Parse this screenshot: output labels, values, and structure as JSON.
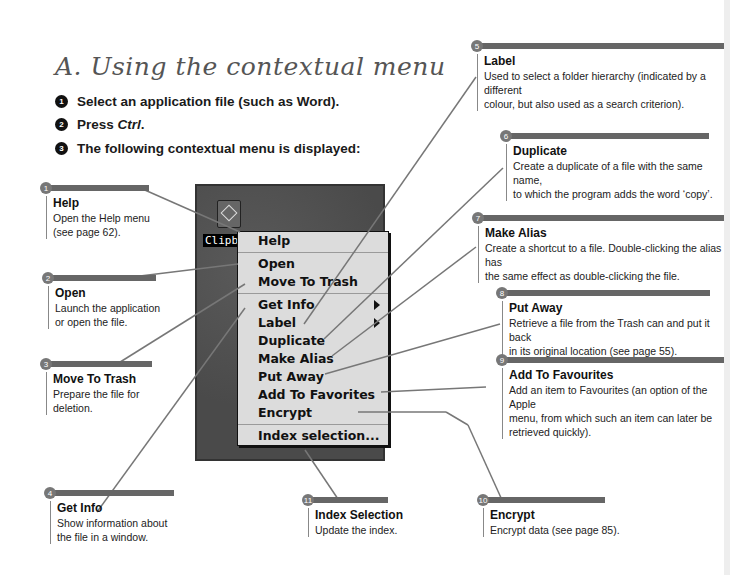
{
  "title": "A. Using the contextual menu",
  "steps": [
    {
      "num": "1",
      "text": "Select an application file (such as Word)."
    },
    {
      "num": "2",
      "text_prefix": "Press ",
      "text_italic": "Ctrl",
      "text_suffix": "."
    },
    {
      "num": "3",
      "text": "The following contextual menu is displayed:"
    }
  ],
  "screenshot": {
    "file_label": "Clipbo",
    "file_icon": "clipboard-icon",
    "menu_items": [
      {
        "label": "Help"
      },
      {
        "label": "Open"
      },
      {
        "label": "Move To Trash"
      },
      {
        "label": "Get Info",
        "submenu": true
      },
      {
        "label": "Label",
        "submenu": true
      },
      {
        "label": "Duplicate"
      },
      {
        "label": "Make Alias"
      },
      {
        "label": "Put Away"
      },
      {
        "label": "Add To Favorites"
      },
      {
        "label": "Encrypt"
      },
      {
        "label": "Index selection..."
      }
    ]
  },
  "callouts": [
    {
      "num": "1",
      "heading": "Help",
      "lines": [
        "Open the Help menu",
        "(see page 62)."
      ]
    },
    {
      "num": "2",
      "heading": "Open",
      "lines": [
        "Launch the application",
        "or open the file."
      ]
    },
    {
      "num": "3",
      "heading": "Move To Trash",
      "lines": [
        "Prepare the file for",
        "deletion."
      ]
    },
    {
      "num": "4",
      "heading": "Get Info",
      "lines": [
        "Show information about",
        "the file in a window."
      ]
    },
    {
      "num": "5",
      "heading": "Label",
      "lines": [
        "Used to select a folder hierarchy (indicated by a different",
        "colour, but also used as a search criterion)."
      ]
    },
    {
      "num": "6",
      "heading": "Duplicate",
      "lines": [
        "Create a duplicate of a file with the same name,",
        "to which the program adds the word ‘copy’."
      ]
    },
    {
      "num": "7",
      "heading": "Make Alias",
      "lines": [
        "Create a shortcut to a file.  Double-clicking the alias has",
        "the same effect as double-clicking the file."
      ]
    },
    {
      "num": "8",
      "heading": "Put Away",
      "lines": [
        "Retrieve a file from the Trash can and put it back",
        "in its original location (see page 55)."
      ]
    },
    {
      "num": "9",
      "heading": "Add To Favourites",
      "lines": [
        "Add an item to Favourites (an option of the Apple",
        "menu, from which such an item can later be",
        "retrieved quickly)."
      ]
    },
    {
      "num": "10",
      "heading": "Encrypt",
      "lines": [
        "Encrypt data (see page 85)."
      ]
    },
    {
      "num": "11",
      "heading": "Index Selection",
      "lines": [
        "Update the index."
      ]
    }
  ],
  "colors": {
    "callout_bar": "#666666",
    "badge": "#777777",
    "desktop_bg": "#4e4e4e",
    "menu_bg": "#dcdcdc"
  }
}
